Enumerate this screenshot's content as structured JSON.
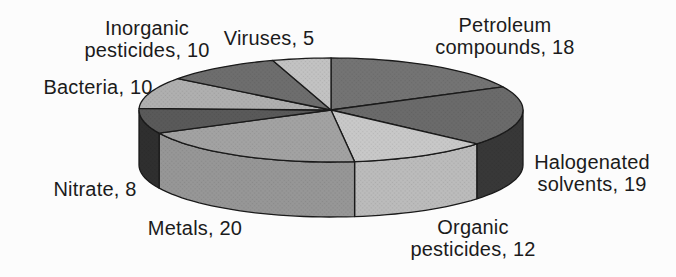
{
  "chart_data": {
    "type": "pie",
    "title": "",
    "style": "3d-grayscale",
    "direction": "clockwise",
    "start_angle_deg": 0,
    "total": 102,
    "categories": [
      "Petroleum compounds",
      "Halogenated solvents",
      "Organic pesticides",
      "Metals",
      "Nitrate",
      "Bacteria",
      "Inorganic pesticides",
      "Viruses"
    ],
    "values": [
      18,
      19,
      12,
      20,
      8,
      10,
      10,
      5
    ],
    "slices": [
      {
        "name": "Petroleum compounds",
        "value": 18,
        "label": "Petroleum\ncompounds, 18",
        "top_color": "#747474",
        "side_color": "#3c3c3c"
      },
      {
        "name": "Halogenated solvents",
        "value": 19,
        "label": "Halogenated\nsolvents, 19",
        "top_color": "#6b6b6b",
        "side_color": "#383838"
      },
      {
        "name": "Organic pesticides",
        "value": 12,
        "label": "Organic\npesticides, 12",
        "top_color": "#c9c9c9",
        "side_color": "#bcbcbc"
      },
      {
        "name": "Metals",
        "value": 20,
        "label": "Metals, 20",
        "top_color": "#a3a3a3",
        "side_color": "#979797"
      },
      {
        "name": "Nitrate",
        "value": 8,
        "label": "Nitrate, 8",
        "top_color": "#5a5a5a",
        "side_color": "#2f2f2f"
      },
      {
        "name": "Bacteria",
        "value": 10,
        "label": "Bacteria, 10",
        "top_color": "#b0b0b0",
        "side_color": "#a3a3a3"
      },
      {
        "name": "Inorganic pesticides",
        "value": 10,
        "label": "Inorganic\npesticides, 10",
        "top_color": "#6e6e6e",
        "side_color": "#404040"
      },
      {
        "name": "Viruses",
        "value": 5,
        "label": "Viruses, 5",
        "top_color": "#c3c3c3",
        "side_color": "#b6b6b6"
      }
    ],
    "legend": "none",
    "colors": {
      "outline": "#1a1a1a",
      "label_text": "#1b1b1b",
      "background": "#fcfcfc"
    }
  }
}
